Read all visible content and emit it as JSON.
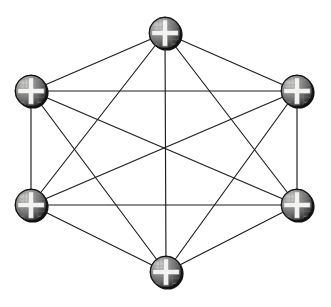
{
  "figure": {
    "title": "",
    "caption": "",
    "background_color": "#ffffff",
    "width": 331,
    "height": 307
  },
  "graph": {
    "type": "complete-graph",
    "name": "K6",
    "node_count": 6,
    "edge_count": 15,
    "layout": "hexagon",
    "edge_color": "#1c1c1c",
    "edge_width": 1.15,
    "node_radius": 16,
    "node_fill_dark": "#3f3f3f",
    "node_fill_light": "#cfcfcf",
    "node_symbol": "cross",
    "node_symbol_color": "#f2f2f0",
    "nodes": [
      {
        "id": "n1",
        "label": "",
        "cx": 165,
        "cy": 33,
        "position": "top"
      },
      {
        "id": "n2",
        "label": "",
        "cx": 31,
        "cy": 91,
        "position": "upper-left"
      },
      {
        "id": "n3",
        "label": "",
        "cx": 297,
        "cy": 91,
        "position": "upper-right"
      },
      {
        "id": "n4",
        "label": "",
        "cx": 31,
        "cy": 205,
        "position": "lower-left"
      },
      {
        "id": "n5",
        "label": "",
        "cx": 297,
        "cy": 205,
        "position": "lower-right"
      },
      {
        "id": "n6",
        "label": "",
        "cx": 166,
        "cy": 272,
        "position": "bottom"
      }
    ],
    "edges": [
      {
        "from": "n1",
        "to": "n2"
      },
      {
        "from": "n1",
        "to": "n3"
      },
      {
        "from": "n1",
        "to": "n4"
      },
      {
        "from": "n1",
        "to": "n5"
      },
      {
        "from": "n1",
        "to": "n6"
      },
      {
        "from": "n2",
        "to": "n3"
      },
      {
        "from": "n2",
        "to": "n4"
      },
      {
        "from": "n2",
        "to": "n5"
      },
      {
        "from": "n2",
        "to": "n6"
      },
      {
        "from": "n3",
        "to": "n4"
      },
      {
        "from": "n3",
        "to": "n5"
      },
      {
        "from": "n3",
        "to": "n6"
      },
      {
        "from": "n4",
        "to": "n5"
      },
      {
        "from": "n4",
        "to": "n6"
      },
      {
        "from": "n5",
        "to": "n6"
      }
    ]
  }
}
